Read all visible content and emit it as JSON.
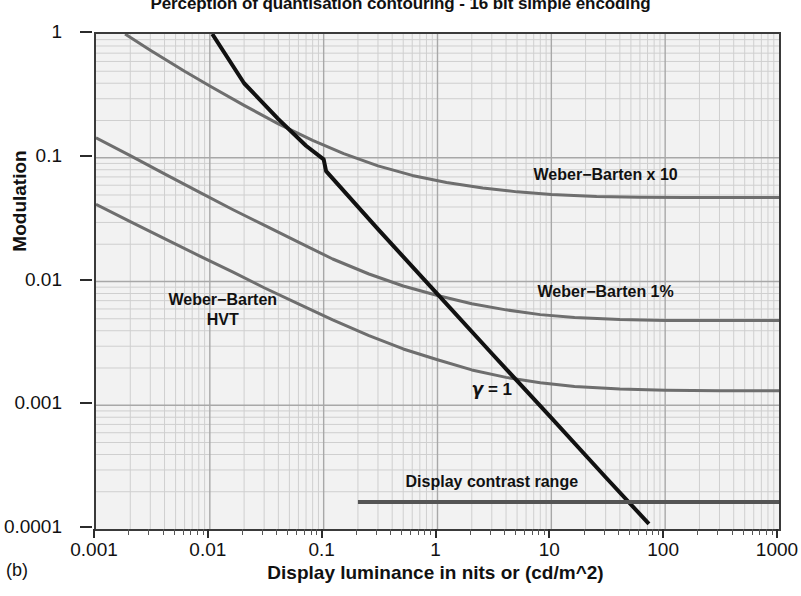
{
  "figure": {
    "title": "Perception of quantisation contouring - 16 bit simple encoding",
    "panel_label": "(b)"
  },
  "chart_data": {
    "type": "line",
    "title": "Perception of quantisation contouring - 16 bit simple encoding",
    "xlabel": "Display luminance in nits or (cd/m^2)",
    "ylabel": "Modulation",
    "xscale": "log",
    "yscale": "log",
    "xlim": [
      0.001,
      1000
    ],
    "ylim": [
      0.0001,
      1
    ],
    "xticks": [
      0.001,
      0.01,
      0.1,
      1,
      10,
      100,
      1000
    ],
    "xticklabels": [
      "0.001",
      "0.01",
      "0.1",
      "1",
      "10",
      "100",
      "1000"
    ],
    "yticks": [
      0.0001,
      0.001,
      0.01,
      0.1,
      1
    ],
    "yticklabels": [
      "0.0001",
      "0.001",
      "0.01",
      "0.1",
      "1"
    ],
    "grid": true,
    "grid_minor": true,
    "legend": "inline-annotations",
    "series": [
      {
        "name": "Weber-Barten x 10",
        "color": "#6e6e6e",
        "width": 3,
        "points": [
          [
            0.0018,
            1.0
          ],
          [
            0.003,
            0.74
          ],
          [
            0.006,
            0.5
          ],
          [
            0.01,
            0.38
          ],
          [
            0.02,
            0.265
          ],
          [
            0.04,
            0.188
          ],
          [
            0.08,
            0.138
          ],
          [
            0.15,
            0.108
          ],
          [
            0.3,
            0.086
          ],
          [
            0.6,
            0.072
          ],
          [
            1.2,
            0.063
          ],
          [
            2.5,
            0.057
          ],
          [
            5,
            0.053
          ],
          [
            10,
            0.0505
          ],
          [
            25,
            0.0487
          ],
          [
            60,
            0.0479
          ],
          [
            150,
            0.0477
          ],
          [
            400,
            0.0477
          ],
          [
            1000,
            0.0477
          ]
        ]
      },
      {
        "name": "Weber-Barten 1%",
        "color": "#6e6e6e",
        "width": 3,
        "points": [
          [
            0.001,
            0.145
          ],
          [
            0.002,
            0.104
          ],
          [
            0.004,
            0.074
          ],
          [
            0.008,
            0.053
          ],
          [
            0.016,
            0.038
          ],
          [
            0.03,
            0.0285
          ],
          [
            0.06,
            0.0208
          ],
          [
            0.12,
            0.0152
          ],
          [
            0.25,
            0.0115
          ],
          [
            0.5,
            0.0092
          ],
          [
            1,
            0.0077
          ],
          [
            2,
            0.0066
          ],
          [
            4,
            0.0059
          ],
          [
            8,
            0.0054
          ],
          [
            16,
            0.00512
          ],
          [
            40,
            0.00492
          ],
          [
            100,
            0.00485
          ],
          [
            300,
            0.00483
          ],
          [
            1000,
            0.00483
          ]
        ]
      },
      {
        "name": "Weber-Barten HVT",
        "color": "#6e6e6e",
        "width": 3,
        "points": [
          [
            0.001,
            0.042
          ],
          [
            0.002,
            0.0305
          ],
          [
            0.004,
            0.0222
          ],
          [
            0.008,
            0.0162
          ],
          [
            0.016,
            0.0119
          ],
          [
            0.03,
            0.0089
          ],
          [
            0.06,
            0.0066
          ],
          [
            0.12,
            0.0049
          ],
          [
            0.25,
            0.00365
          ],
          [
            0.5,
            0.00285
          ],
          [
            1,
            0.00233
          ],
          [
            2,
            0.00193
          ],
          [
            4,
            0.00168
          ],
          [
            8,
            0.00152
          ],
          [
            16,
            0.00142
          ],
          [
            40,
            0.00135
          ],
          [
            100,
            0.00132
          ],
          [
            300,
            0.00131
          ],
          [
            1000,
            0.00131
          ]
        ]
      },
      {
        "name": "gamma = 1",
        "color": "#111111",
        "width": 4,
        "points": [
          [
            0.0105,
            1.0
          ],
          [
            0.02,
            0.4
          ],
          [
            0.04,
            0.205
          ],
          [
            0.07,
            0.125
          ],
          [
            0.1,
            0.097
          ],
          [
            0.105,
            0.078
          ],
          [
            0.3,
            0.0265
          ],
          [
            1,
            0.0079
          ],
          [
            3,
            0.00262
          ],
          [
            10,
            0.00079
          ],
          [
            30,
            0.000262
          ],
          [
            72,
            0.00011
          ]
        ]
      },
      {
        "name": "Display contrast range",
        "color": "#555555",
        "width": 4,
        "type": "hbar",
        "points": [
          [
            0.2,
            0.000165
          ],
          [
            1000,
            0.000165
          ]
        ]
      }
    ],
    "annotations": [
      {
        "id": "wb-x10",
        "text": "Weber−Barten x 10",
        "x": 30,
        "y": 0.073
      },
      {
        "id": "wb-1pct",
        "text": "Weber−Barten 1%",
        "x": 30,
        "y": 0.0082
      },
      {
        "id": "wb-hvt-line1",
        "text": "Weber−Barten",
        "x": 0.013,
        "y": 0.0072
      },
      {
        "id": "wb-hvt-line2",
        "text": "HVT",
        "x": 0.013,
        "y": 0.0049
      },
      {
        "id": "gamma",
        "text": "γ = 1",
        "x": 3.0,
        "y": 0.00135
      },
      {
        "id": "contrast-range",
        "text": "Display contrast range",
        "x": 3.0,
        "y": 0.00024
      }
    ]
  },
  "labels": {
    "wb_x10": "Weber−Barten x 10",
    "wb_1pct": "Weber−Barten 1%",
    "wb_hvt_1": "Weber−Barten",
    "wb_hvt_2": "HVT",
    "gamma_sym": "γ",
    "gamma_eq": "= 1",
    "contrast_range": "Display contrast range"
  },
  "colors": {
    "curve_gray": "#6e6e6e",
    "curve_black": "#111111",
    "bar_gray": "#555555",
    "plot_bg": "#f2f2f2",
    "grid_major": "#a8a8a8",
    "grid_minor": "#cfcfcf",
    "axis": "#3a3a3a"
  }
}
